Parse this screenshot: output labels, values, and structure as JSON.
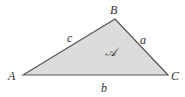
{
  "diagram": {
    "type": "triangle",
    "fill_color": "#dcdcdc",
    "stroke_color": "#555555",
    "vertices": [
      {
        "label": "A",
        "x": 23,
        "y": 75
      },
      {
        "label": "B",
        "x": 115,
        "y": 19
      },
      {
        "label": "C",
        "x": 168,
        "y": 75
      }
    ],
    "sides": [
      {
        "label": "a",
        "between": "B-C"
      },
      {
        "label": "b",
        "between": "A-C"
      },
      {
        "label": "c",
        "between": "A-B"
      }
    ],
    "area_label": "𝒜",
    "labels": {
      "A": "A",
      "B": "B",
      "C": "C",
      "a": "a",
      "b": "b",
      "c": "c",
      "area": "𝒜"
    }
  }
}
